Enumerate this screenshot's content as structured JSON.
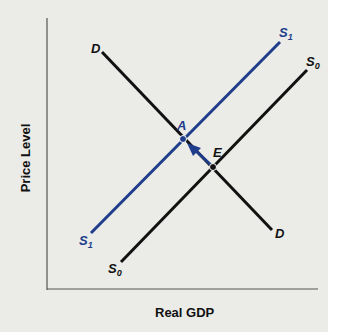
{
  "diagram": {
    "type": "aggregate supply and demand",
    "x_axis_label": "Real GDP",
    "y_axis_label": "Price Level",
    "curves": [
      {
        "id": "D",
        "label": "D",
        "color": "#111111",
        "from_label": "D",
        "to_label": "D"
      },
      {
        "id": "S0",
        "label": "S",
        "subscript": "0",
        "color": "#111111"
      },
      {
        "id": "S1",
        "label": "S",
        "subscript": "1",
        "color": "#1f3d8a"
      }
    ],
    "points": [
      {
        "id": "A",
        "label": "A",
        "color": "#1f3d8a"
      },
      {
        "id": "E",
        "label": "E",
        "color": "#111111"
      }
    ],
    "arrow": {
      "from": "E",
      "to": "A",
      "color": "#1f3d8a"
    },
    "colors": {
      "background": "#ebece8",
      "shift_blue": "#1f3d8a",
      "black": "#111111"
    }
  }
}
